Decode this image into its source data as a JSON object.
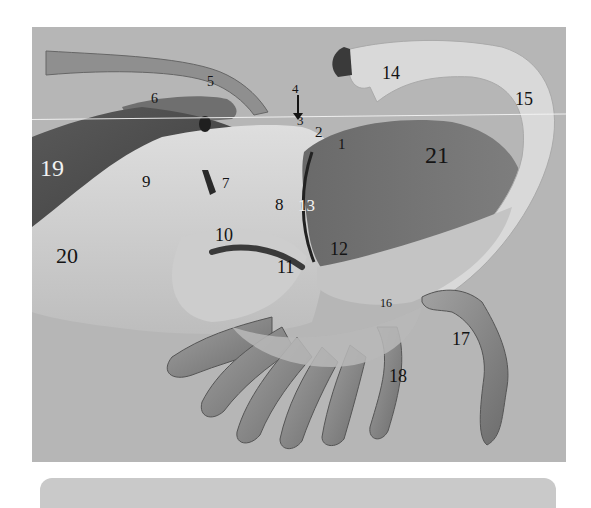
{
  "figure": {
    "type": "anatomical specimen photograph (grayscale)",
    "background_color": "#b6b6b6",
    "labels": [
      {
        "id": "1",
        "text": "1",
        "x": 338,
        "y": 137,
        "size": 15,
        "color": "dark"
      },
      {
        "id": "2",
        "text": "2",
        "x": 315,
        "y": 125,
        "size": 15,
        "color": "dark"
      },
      {
        "id": "3",
        "text": "3",
        "x": 297,
        "y": 114,
        "size": 13,
        "color": "dark"
      },
      {
        "id": "4",
        "text": "4",
        "x": 292,
        "y": 82,
        "size": 13,
        "color": "dark"
      },
      {
        "id": "5",
        "text": "5",
        "x": 207,
        "y": 75,
        "size": 14,
        "color": "dark"
      },
      {
        "id": "6",
        "text": "6",
        "x": 151,
        "y": 92,
        "size": 14,
        "color": "dark"
      },
      {
        "id": "7",
        "text": "7",
        "x": 222,
        "y": 176,
        "size": 15,
        "color": "dark"
      },
      {
        "id": "8",
        "text": "8",
        "x": 275,
        "y": 196,
        "size": 17,
        "color": "dark"
      },
      {
        "id": "9",
        "text": "9",
        "x": 142,
        "y": 173,
        "size": 17,
        "color": "dark"
      },
      {
        "id": "10",
        "text": "10",
        "x": 215,
        "y": 226,
        "size": 18,
        "color": "dark"
      },
      {
        "id": "11",
        "text": "11",
        "x": 277,
        "y": 258,
        "size": 18,
        "color": "dark"
      },
      {
        "id": "12",
        "text": "12",
        "x": 330,
        "y": 240,
        "size": 18,
        "color": "dark"
      },
      {
        "id": "13",
        "text": "13",
        "x": 298,
        "y": 197,
        "size": 17,
        "color": "white"
      },
      {
        "id": "14",
        "text": "14",
        "x": 382,
        "y": 64,
        "size": 18,
        "color": "dark"
      },
      {
        "id": "15",
        "text": "15",
        "x": 515,
        "y": 90,
        "size": 18,
        "color": "dark"
      },
      {
        "id": "16",
        "text": "16",
        "x": 380,
        "y": 297,
        "size": 12,
        "color": "dark"
      },
      {
        "id": "17",
        "text": "17",
        "x": 452,
        "y": 330,
        "size": 18,
        "color": "dark"
      },
      {
        "id": "18",
        "text": "18",
        "x": 389,
        "y": 367,
        "size": 18,
        "color": "dark"
      },
      {
        "id": "19",
        "text": "19",
        "x": 40,
        "y": 156,
        "size": 24,
        "color": "white"
      },
      {
        "id": "20",
        "text": "20",
        "x": 56,
        "y": 245,
        "size": 22,
        "color": "dark"
      },
      {
        "id": "21",
        "text": "21",
        "x": 425,
        "y": 143,
        "size": 24,
        "color": "dark"
      }
    ],
    "arrow": {
      "label_id": "4",
      "x": 297,
      "y": 97,
      "length": 20
    }
  },
  "caption_bar": {
    "color": "#c9c9c9"
  }
}
